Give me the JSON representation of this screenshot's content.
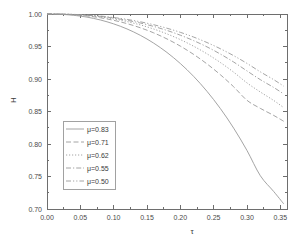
{
  "chart_data": {
    "type": "line",
    "title": "",
    "xlabel": "τ",
    "ylabel": "H",
    "xlim": [
      0.0,
      0.36
    ],
    "ylim": [
      0.7,
      1.0
    ],
    "xticks": [
      "0.00",
      "0.05",
      "0.10",
      "0.15",
      "0.20",
      "0.25",
      "0.30",
      "0.35"
    ],
    "xtick_values": [
      0.0,
      0.05,
      0.1,
      0.15,
      0.2,
      0.25,
      0.3,
      0.35
    ],
    "yticks": [
      "0.70",
      "0.75",
      "0.80",
      "0.85",
      "0.90",
      "0.95",
      "1.00"
    ],
    "ytick_values": [
      0.7,
      0.75,
      0.8,
      0.85,
      0.9,
      0.95,
      1.0
    ],
    "grid": false,
    "legend_position": "center-left",
    "line_color": "#9a9a9a",
    "axis_color": "#6e6e6e",
    "x": [
      0.0,
      0.02,
      0.04,
      0.06,
      0.08,
      0.1,
      0.12,
      0.14,
      0.16,
      0.18,
      0.2,
      0.22,
      0.24,
      0.26,
      0.28,
      0.3,
      0.32,
      0.34,
      0.355
    ],
    "series": [
      {
        "name": "μ=0.83",
        "dash": "solid",
        "values": [
          1.0,
          0.9995,
          0.998,
          0.9952,
          0.9908,
          0.9848,
          0.977,
          0.9672,
          0.9552,
          0.9408,
          0.9238,
          0.904,
          0.881,
          0.8546,
          0.8244,
          0.79,
          0.7512,
          0.727,
          0.708
        ]
      },
      {
        "name": "μ=0.71",
        "dash": "dashed",
        "values": [
          1.0,
          0.9997,
          0.9988,
          0.997,
          0.9942,
          0.9903,
          0.9852,
          0.9788,
          0.971,
          0.9616,
          0.9506,
          0.9378,
          0.9232,
          0.9066,
          0.888,
          0.8672,
          0.8548,
          0.844,
          0.835
        ]
      },
      {
        "name": "μ=0.62",
        "dash": "dotted",
        "values": [
          1.0,
          0.9998,
          0.9991,
          0.9977,
          0.9955,
          0.9924,
          0.9883,
          0.9832,
          0.9769,
          0.9694,
          0.9606,
          0.9504,
          0.9387,
          0.9254,
          0.9105,
          0.894,
          0.88,
          0.867,
          0.856
        ]
      },
      {
        "name": "μ=0.55",
        "dash": "dashdot",
        "values": [
          1.0,
          0.9998,
          0.9993,
          0.9981,
          0.9963,
          0.9937,
          0.9903,
          0.9861,
          0.9809,
          0.9747,
          0.9674,
          0.959,
          0.9494,
          0.9384,
          0.9261,
          0.9124,
          0.899,
          0.887,
          0.877
        ]
      },
      {
        "name": "μ=0.50",
        "dash": "dashdotdot",
        "values": [
          1.0,
          0.9999,
          0.9994,
          0.9984,
          0.9969,
          0.9946,
          0.9917,
          0.988,
          0.9835,
          0.9781,
          0.9718,
          0.9645,
          0.9561,
          0.9466,
          0.9359,
          0.924,
          0.911,
          0.899,
          0.889
        ]
      }
    ]
  },
  "legend": {
    "entries": [
      {
        "label": "μ=0.83"
      },
      {
        "label": "μ=0.71"
      },
      {
        "label": "μ=0.62"
      },
      {
        "label": "μ=0.55"
      },
      {
        "label": "μ=0.50"
      }
    ]
  },
  "axes": {
    "x_label": "τ",
    "y_label": "H"
  }
}
